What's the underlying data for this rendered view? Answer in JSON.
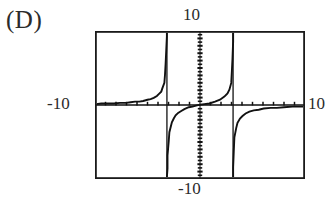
{
  "figure": {
    "choice_label": "(D)"
  },
  "axis_labels": {
    "top": "10",
    "bottom": "-10",
    "left": "-10",
    "right": "10"
  },
  "colors": {
    "ink": "#231f20",
    "frame": "#1a1a1a",
    "curve": "#111111",
    "background": "#ffffff"
  },
  "chart_data": {
    "type": "line",
    "title": "",
    "subtitle": "",
    "xlabel": "",
    "ylabel": "",
    "xlim": [
      -10,
      10
    ],
    "ylim": [
      -10,
      10
    ],
    "grid": false,
    "legend": null,
    "xticks": [
      -9,
      -8,
      -7,
      -6,
      -5,
      -4,
      -3,
      -2,
      -1,
      0,
      1,
      2,
      3,
      4,
      5,
      6,
      7,
      8,
      9
    ],
    "yticks": [
      -9,
      -8,
      -7,
      -6,
      -5,
      -4,
      -3,
      -2,
      -1,
      0,
      1,
      2,
      3,
      4,
      5,
      6,
      7,
      8,
      9
    ],
    "xtick_labels": [
      "-10",
      "10"
    ],
    "ytick_labels": [
      "-10",
      "10"
    ],
    "asymptotes_x": [
      -3.15,
      3.15
    ],
    "annotations": [],
    "series": [
      {
        "name": "branch-left",
        "comment": "rises from just above y=0 at the left edge up to +infinity at x=-3.15",
        "x": [
          -10.0,
          -9.4,
          -8.8,
          -8.2,
          -7.6,
          -7.0,
          -6.6,
          -6.2,
          -5.8,
          -5.4,
          -5.0,
          -4.7,
          -4.4,
          -4.1,
          -3.9,
          -3.7,
          -3.55,
          -3.42,
          -3.32,
          -3.25,
          -3.2,
          -3.17,
          -3.16
        ],
        "y": [
          0.15,
          0.17,
          0.2,
          0.23,
          0.27,
          0.32,
          0.36,
          0.42,
          0.48,
          0.57,
          0.68,
          0.8,
          0.96,
          1.2,
          1.45,
          1.8,
          2.3,
          3.0,
          4.1,
          5.6,
          7.4,
          9.2,
          10.0
        ]
      },
      {
        "name": "branch-middle",
        "comment": "comes up from -infinity at x=-3.15, passes near the origin, goes to +infinity at x=3.15",
        "x": [
          -3.14,
          -3.12,
          -3.08,
          -3.0,
          -2.9,
          -2.8,
          -2.65,
          -2.5,
          -2.3,
          -2.1,
          -1.8,
          -1.5,
          -1.1,
          -0.7,
          -0.3,
          0.0,
          0.4,
          0.9,
          1.4,
          1.9,
          2.3,
          2.6,
          2.8,
          2.95,
          3.05,
          3.1,
          3.13,
          3.14
        ],
        "y": [
          -10.0,
          -8.6,
          -6.8,
          -4.9,
          -3.7,
          -3.0,
          -2.3,
          -1.85,
          -1.4,
          -1.1,
          -0.78,
          -0.56,
          -0.34,
          -0.18,
          -0.06,
          0.0,
          0.08,
          0.22,
          0.42,
          0.72,
          1.1,
          1.55,
          2.1,
          3.0,
          4.6,
          6.3,
          8.6,
          10.0
        ]
      },
      {
        "name": "branch-right",
        "comment": "rises from -infinity at x=3.15 and flattens toward y=0 at the right edge",
        "x": [
          3.16,
          3.18,
          3.22,
          3.3,
          3.45,
          3.6,
          3.8,
          4.05,
          4.35,
          4.7,
          5.1,
          5.6,
          6.1,
          6.7,
          7.3,
          8.0,
          8.8,
          9.5,
          10.0
        ],
        "y": [
          -10.0,
          -8.4,
          -6.3,
          -4.4,
          -3.1,
          -2.4,
          -1.85,
          -1.45,
          -1.15,
          -0.92,
          -0.74,
          -0.6,
          -0.5,
          -0.42,
          -0.36,
          -0.31,
          -0.26,
          -0.23,
          -0.21
        ]
      }
    ]
  }
}
